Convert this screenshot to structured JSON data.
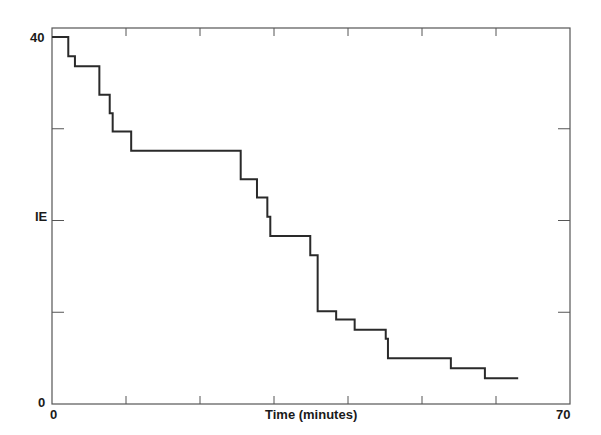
{
  "chart_data": {
    "type": "line",
    "subtype": "step",
    "title": "",
    "xlabel": "Time (minutes)",
    "ylabel": "IE",
    "xlim": [
      0,
      70
    ],
    "ylim": [
      0,
      40
    ],
    "x_tick_labels": [
      "0",
      "70"
    ],
    "x_ticks": [
      0,
      10,
      20,
      30,
      40,
      50,
      60,
      70
    ],
    "y_tick_labels": [
      "0",
      "IE",
      "40"
    ],
    "y_ticks": [
      0,
      10,
      20,
      30,
      40
    ],
    "grid": false,
    "legend": null,
    "line_color": "#2a2a2a",
    "series": [
      {
        "name": "IE",
        "x": [
          0,
          2.2,
          3.1,
          6.4,
          7.8,
          8.2,
          10.7,
          25.5,
          27.7,
          29.1,
          29.5,
          34.9,
          35.9,
          38.4,
          40.9,
          45.1,
          45.4,
          53.9,
          58.5,
          63.0
        ],
        "y": [
          40,
          37.9,
          36.8,
          33.7,
          31.7,
          29.7,
          27.6,
          24.5,
          22.5,
          20.4,
          18.3,
          16.2,
          10.1,
          9.2,
          8.1,
          7.1,
          5.0,
          3.9,
          2.8,
          2.8
        ]
      }
    ]
  },
  "labels": {
    "y_top": "40",
    "y_mid": "IE",
    "y_bottom": "0",
    "x_left": "0",
    "x_center": "Time (minutes)",
    "x_right": "70"
  }
}
